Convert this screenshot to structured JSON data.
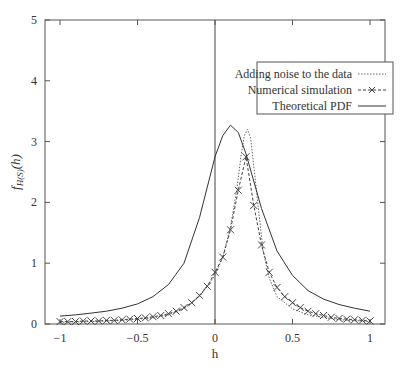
{
  "chart_data": {
    "type": "line",
    "title": "",
    "xlabel": "h",
    "ylabel": "f_{H(S)}(h)",
    "xlim": [
      -1.1,
      1.1
    ],
    "ylim": [
      0,
      5
    ],
    "grid": false,
    "legend_position": "upper right",
    "xticks": [
      "-1",
      "-0.5",
      "0",
      "0.5",
      "1"
    ],
    "xtick_values": [
      -1,
      -0.5,
      0,
      0.5,
      1
    ],
    "yticks": [
      "0",
      "1",
      "2",
      "3",
      "4",
      "5"
    ],
    "ytick_values": [
      0,
      1,
      2,
      3,
      4,
      5
    ],
    "vertical_line_x": 0,
    "series": [
      {
        "name": "Adding noise to the data",
        "style": "dotted",
        "x": [
          -1,
          -0.8,
          -0.6,
          -0.4,
          -0.3,
          -0.2,
          -0.1,
          0,
          0.05,
          0.1,
          0.14,
          0.17,
          0.19,
          0.21,
          0.23,
          0.25,
          0.28,
          0.31,
          0.35,
          0.4,
          0.5,
          0.6,
          0.8,
          1
        ],
        "y": [
          0.03,
          0.04,
          0.06,
          0.1,
          0.15,
          0.25,
          0.45,
          0.8,
          1.1,
          1.6,
          2.2,
          2.8,
          3.1,
          3.2,
          3.05,
          2.6,
          1.9,
          1.2,
          0.75,
          0.45,
          0.25,
          0.15,
          0.07,
          0.04
        ]
      },
      {
        "name": "Numerical simulation",
        "style": "dashed-x",
        "x": [
          -1,
          -0.95,
          -0.9,
          -0.85,
          -0.8,
          -0.75,
          -0.7,
          -0.65,
          -0.6,
          -0.55,
          -0.5,
          -0.45,
          -0.4,
          -0.35,
          -0.3,
          -0.25,
          -0.2,
          -0.15,
          -0.1,
          -0.05,
          0,
          0.05,
          0.1,
          0.15,
          0.2,
          0.25,
          0.3,
          0.35,
          0.4,
          0.45,
          0.5,
          0.55,
          0.6,
          0.65,
          0.7,
          0.75,
          0.8,
          0.85,
          0.9,
          0.95,
          1
        ],
        "y": [
          0.04,
          0.04,
          0.04,
          0.05,
          0.05,
          0.05,
          0.06,
          0.06,
          0.07,
          0.08,
          0.09,
          0.1,
          0.12,
          0.14,
          0.17,
          0.21,
          0.27,
          0.35,
          0.47,
          0.62,
          0.85,
          1.1,
          1.55,
          2.2,
          2.75,
          1.95,
          1.3,
          0.85,
          0.6,
          0.45,
          0.35,
          0.27,
          0.21,
          0.17,
          0.14,
          0.11,
          0.09,
          0.08,
          0.07,
          0.06,
          0.05
        ]
      },
      {
        "name": "Theoretical PDF",
        "style": "solid",
        "x": [
          -1,
          -0.9,
          -0.8,
          -0.7,
          -0.6,
          -0.5,
          -0.4,
          -0.3,
          -0.2,
          -0.1,
          0,
          0.05,
          0.1,
          0.15,
          0.2,
          0.3,
          0.4,
          0.5,
          0.6,
          0.7,
          0.8,
          0.9,
          1
        ],
        "y": [
          0.13,
          0.15,
          0.18,
          0.21,
          0.26,
          0.33,
          0.45,
          0.65,
          1.0,
          1.75,
          2.75,
          3.1,
          3.27,
          3.15,
          2.8,
          1.9,
          1.2,
          0.8,
          0.55,
          0.41,
          0.32,
          0.26,
          0.21
        ]
      }
    ]
  },
  "legend": {
    "items": [
      {
        "label": "Adding noise to the data"
      },
      {
        "label": "Numerical simulation"
      },
      {
        "label": "Theoretical PDF"
      }
    ]
  },
  "axes": {
    "xlabel": "h",
    "ylabel_main": "f",
    "ylabel_sub": "H(S)",
    "ylabel_arg": "(h)"
  }
}
